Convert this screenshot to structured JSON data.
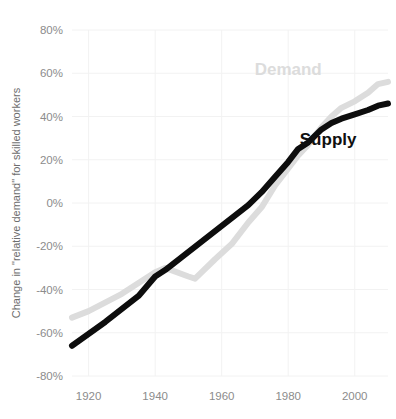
{
  "chart_data": {
    "type": "line",
    "title": "",
    "subtitle": "",
    "xlabel": "",
    "ylabel": "Change in \"relative demand\" for skilled workers",
    "xlim": [
      1915,
      2010
    ],
    "ylim": [
      -80,
      80
    ],
    "grid": true,
    "legend_position": "inline-annotations",
    "x_ticks": [
      1920,
      1940,
      1960,
      1980,
      2000
    ],
    "x_tick_labels": [
      "1920",
      "1940",
      "1960",
      "1980",
      "2000"
    ],
    "y_ticks": [
      -80,
      -60,
      -40,
      -20,
      0,
      20,
      40,
      60,
      80
    ],
    "y_tick_labels": [
      "-80%",
      "-60%",
      "-40%",
      "-20%",
      "0%",
      "20%",
      "40%",
      "60%",
      "80%"
    ],
    "series": [
      {
        "name": "Demand",
        "color": "#dcdcdc",
        "label_x": 1980,
        "label_y": 59,
        "x": [
          1915,
          1920,
          1930,
          1940,
          1943,
          1950,
          1952,
          1958,
          1963,
          1968,
          1972,
          1976,
          1980,
          1983,
          1986,
          1990,
          1993,
          1996,
          2000,
          2004,
          2007,
          2010
        ],
        "values": [
          -53,
          -50,
          -42,
          -32,
          -30,
          -34,
          -35,
          -26,
          -19,
          -9,
          -2,
          8,
          16,
          22,
          27,
          35,
          40,
          44,
          47,
          51,
          55,
          56
        ]
      },
      {
        "name": "Supply",
        "color": "#0d0d0d",
        "label_x": 1992,
        "label_y": 27,
        "x": [
          1915,
          1925,
          1935,
          1940,
          1943,
          1948,
          1953,
          1958,
          1963,
          1968,
          1972,
          1976,
          1980,
          1983,
          1986,
          1990,
          1993,
          1996,
          2000,
          2004,
          2007,
          2010
        ],
        "values": [
          -66,
          -55,
          -43,
          -34,
          -31,
          -25,
          -19,
          -13,
          -7,
          -1,
          5,
          12,
          19,
          25,
          28,
          34,
          37,
          39,
          41,
          43,
          45,
          46
        ]
      }
    ]
  },
  "annotations": {
    "demand_label": "Demand",
    "supply_label": "Supply"
  },
  "axes": {
    "y_title": "Change in \"relative demand\" for skilled workers"
  }
}
